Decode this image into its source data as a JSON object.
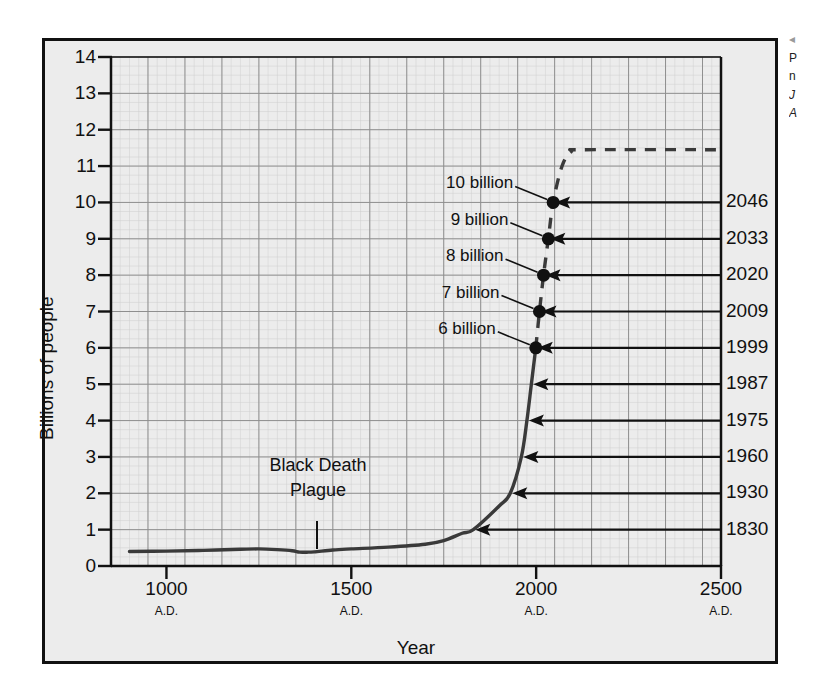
{
  "figure": {
    "background_color": "#ffffff",
    "plot_background_color": "#ececec",
    "frame_color": "#111111",
    "grid_color": "#8f8f8f",
    "curve_color": "#3a3a3a"
  },
  "caption": {
    "marker": "◂",
    "line1": "P",
    "line2": "n",
    "line3": "J",
    "line4": "A"
  },
  "chart_data": {
    "type": "line",
    "title": "",
    "xlabel": "Year",
    "ylabel": "Billions of people",
    "xlim": [
      850,
      2500
    ],
    "ylim": [
      0,
      14
    ],
    "grid": true,
    "legend": "none",
    "x_ticks": [
      {
        "value": 1000,
        "label": "1000",
        "sublabel": "A.D."
      },
      {
        "value": 1500,
        "label": "1500",
        "sublabel": "A.D."
      },
      {
        "value": 2000,
        "label": "2000",
        "sublabel": "A.D."
      },
      {
        "value": 2500,
        "label": "2500",
        "sublabel": "A.D."
      }
    ],
    "y_ticks": [
      {
        "value": 0,
        "label": "0"
      },
      {
        "value": 1,
        "label": "1"
      },
      {
        "value": 2,
        "label": "2"
      },
      {
        "value": 3,
        "label": "3"
      },
      {
        "value": 4,
        "label": "4"
      },
      {
        "value": 5,
        "label": "5"
      },
      {
        "value": 6,
        "label": "6"
      },
      {
        "value": 7,
        "label": "7"
      },
      {
        "value": 8,
        "label": "8"
      },
      {
        "value": 9,
        "label": "9"
      },
      {
        "value": 10,
        "label": "10"
      },
      {
        "value": 11,
        "label": "11"
      },
      {
        "value": 12,
        "label": "12"
      },
      {
        "value": 13,
        "label": "13"
      },
      {
        "value": 14,
        "label": "14"
      }
    ],
    "series": [
      {
        "name": "Historical world population",
        "style": "solid",
        "points": [
          [
            900,
            0.4
          ],
          [
            1000,
            0.41
          ],
          [
            1100,
            0.43
          ],
          [
            1200,
            0.46
          ],
          [
            1250,
            0.47
          ],
          [
            1300,
            0.45
          ],
          [
            1340,
            0.42
          ],
          [
            1360,
            0.38
          ],
          [
            1380,
            0.38
          ],
          [
            1400,
            0.39
          ],
          [
            1450,
            0.44
          ],
          [
            1500,
            0.47
          ],
          [
            1600,
            0.52
          ],
          [
            1700,
            0.6
          ],
          [
            1750,
            0.7
          ],
          [
            1800,
            0.9
          ],
          [
            1830,
            1.0
          ],
          [
            1900,
            1.65
          ],
          [
            1930,
            2.0
          ],
          [
            1960,
            3.0
          ],
          [
            1975,
            4.0
          ],
          [
            1987,
            5.0
          ],
          [
            1999,
            6.0
          ]
        ]
      },
      {
        "name": "Projected world population",
        "style": "dashed",
        "points": [
          [
            1999,
            6.0
          ],
          [
            2009,
            7.0
          ],
          [
            2020,
            8.0
          ],
          [
            2033,
            9.0
          ],
          [
            2046,
            10.0
          ],
          [
            2070,
            11.0
          ],
          [
            2095,
            11.4
          ],
          [
            2130,
            11.45
          ],
          [
            2500,
            11.45
          ]
        ]
      }
    ],
    "milestones": [
      {
        "population": 10,
        "label": "10 billion",
        "year_label": "2046",
        "year": 2046
      },
      {
        "population": 9,
        "label": "9 billion",
        "year_label": "2033",
        "year": 2033
      },
      {
        "population": 8,
        "label": "8 billion",
        "year_label": "2020",
        "year": 2020
      },
      {
        "population": 7,
        "label": "7 billion",
        "year_label": "2009",
        "year": 2009
      },
      {
        "population": 6,
        "label": "6 billion",
        "year_label": "1999",
        "year": 1999
      },
      {
        "population": 5,
        "label": "",
        "year_label": "1987",
        "year": 1987
      },
      {
        "population": 4,
        "label": "",
        "year_label": "1975",
        "year": 1975
      },
      {
        "population": 3,
        "label": "",
        "year_label": "1960",
        "year": 1960
      },
      {
        "population": 2,
        "label": "",
        "year_label": "1930",
        "year": 1930
      },
      {
        "population": 1,
        "label": "",
        "year_label": "1830",
        "year": 1830
      }
    ],
    "annotations": [
      {
        "line1": "Black Death",
        "line2": "Plague",
        "at_year": 1350,
        "at_population": 0.42
      }
    ]
  }
}
